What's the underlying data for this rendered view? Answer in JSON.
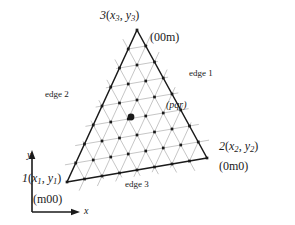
{
  "figure": {
    "background": "#ffffff",
    "ink": "#1a1a1a",
    "grid_color": "#b8b8b8",
    "subdivisions": 8,
    "vertices": {
      "v1": {
        "x": 67,
        "y": 182,
        "label": "1",
        "coord_label": "(x1, y1)",
        "code": "(m00)"
      },
      "v2": {
        "x": 207,
        "y": 158,
        "label": "2",
        "coord_label": "(x2, y2)",
        "code": "(0m0)"
      },
      "v3": {
        "x": 137,
        "y": 30,
        "label": "3",
        "coord_label": "(x3, y3)",
        "code": "(00m)"
      }
    },
    "marked_point": {
      "x": 131,
      "y": 117,
      "label": "(pqr)"
    }
  },
  "labels": {
    "apex_vertex": "3",
    "apex_coords_open": "(",
    "apex_x": "x",
    "apex_x_sub": "3",
    "apex_comma": ", ",
    "apex_y": "y",
    "apex_y_sub": "3",
    "apex_coords_close": ")",
    "apex_code": "(00m)",
    "right_vertex": "2",
    "right_x": "x",
    "right_x_sub": "2",
    "right_y": "y",
    "right_y_sub": "2",
    "right_code": "(0m0)",
    "left_vertex": "1",
    "left_x": "x",
    "left_x_sub": "1",
    "left_y": "y",
    "left_y_sub": "1",
    "left_code": "(m00)",
    "edge1": "edge 1",
    "edge2": "edge 2",
    "edge3": "edge 3",
    "pqr": "(pqr)",
    "axis_x": "x",
    "axis_y": "y"
  }
}
